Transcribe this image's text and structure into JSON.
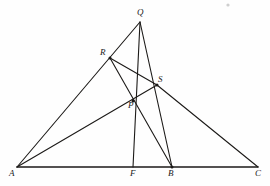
{
  "figure": {
    "background_color": "#fefefe",
    "stroke_color": "#1c1a18",
    "width": 270,
    "height": 186,
    "points": [
      {
        "id": "A",
        "label": "A",
        "x": 17,
        "y": 167,
        "label_x": 9,
        "label_y": 169
      },
      {
        "id": "Q",
        "label": "Q",
        "x": 140,
        "y": 22,
        "label_x": 137,
        "label_y": 8
      },
      {
        "id": "C",
        "label": "C",
        "x": 258,
        "y": 167,
        "label_x": 255,
        "label_y": 169
      },
      {
        "id": "R",
        "label": "R",
        "x": 110,
        "y": 58,
        "label_x": 100,
        "label_y": 48
      },
      {
        "id": "S",
        "label": "S",
        "x": 157,
        "y": 85,
        "label_x": 158,
        "label_y": 75
      },
      {
        "id": "P",
        "label": "P",
        "x": 133,
        "y": 101,
        "label_x": 128,
        "label_y": 101
      },
      {
        "id": "F",
        "label": "F",
        "x": 133,
        "y": 167,
        "label_x": 130,
        "label_y": 169
      },
      {
        "id": "B",
        "label": "B",
        "x": 172,
        "y": 167,
        "label_x": 168,
        "label_y": 169
      }
    ],
    "segments": [
      {
        "id": "AC",
        "name": "base-line-A-C",
        "from": "A",
        "to": "C",
        "width": 1.5
      },
      {
        "id": "AQ",
        "name": "line-A-through-R-to-Q",
        "from": "A",
        "to": "Q",
        "width": 1.1
      },
      {
        "id": "QF",
        "name": "cevian-Q-to-F",
        "from": "Q",
        "to": "F",
        "width": 1.1
      },
      {
        "id": "QB",
        "name": "cevian-Q-through-S-to-B",
        "from": "Q",
        "to": "B",
        "width": 1.1
      },
      {
        "id": "AS",
        "name": "cevian-A-through-P-to-S",
        "from": "A",
        "to": "S",
        "width": 1.1
      },
      {
        "id": "RB",
        "name": "cevian-R-through-P-to-B",
        "from": "R",
        "to": "B",
        "width": 1.1
      },
      {
        "id": "RS",
        "name": "segment-R-to-S",
        "from": "R",
        "to": "S",
        "width": 1.1
      },
      {
        "id": "SC",
        "name": "segment-S-to-C",
        "from": "S",
        "to": "C",
        "width": 1.1
      }
    ],
    "marked_vertices": [
      "R",
      "S",
      "P",
      "B"
    ],
    "speck": {
      "x": 228,
      "y": 5,
      "r": 1.6
    }
  }
}
